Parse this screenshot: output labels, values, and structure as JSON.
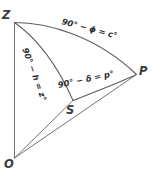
{
  "diagram": {
    "background_color": "#ffffff",
    "stroke_color": "#5d5d5d",
    "text_color": "#2f2f2f",
    "vertices": [
      {
        "id": "Z",
        "label": "Z",
        "x": 14,
        "y": 22
      },
      {
        "id": "P",
        "label": "P",
        "x": 136,
        "y": 75
      },
      {
        "id": "S",
        "label": "S",
        "x": 73,
        "y": 101
      },
      {
        "id": "O",
        "label": "O",
        "x": 14,
        "y": 158
      }
    ],
    "arc_labels": [
      {
        "id": "zp",
        "text": "90° − ϕ = c°",
        "between": "Z-P",
        "rotation_deg": 15
      },
      {
        "id": "zs",
        "text": "90° − h = z°",
        "between": "Z-S",
        "rotation_deg": 70
      },
      {
        "id": "sp",
        "text": "90° − δ = p°",
        "between": "S-P",
        "rotation_deg": -12
      }
    ],
    "edges": [
      {
        "id": "arc-z-p",
        "from": "Z",
        "to": "P",
        "kind": "arc"
      },
      {
        "id": "arc-z-s",
        "from": "Z",
        "to": "S",
        "kind": "arc"
      },
      {
        "id": "arc-s-p",
        "from": "S",
        "to": "P",
        "kind": "arc"
      },
      {
        "id": "line-o-z",
        "from": "O",
        "to": "Z",
        "kind": "line"
      },
      {
        "id": "line-o-s",
        "from": "O",
        "to": "S",
        "kind": "line"
      },
      {
        "id": "line-o-p",
        "from": "O",
        "to": "P",
        "kind": "line"
      }
    ]
  }
}
